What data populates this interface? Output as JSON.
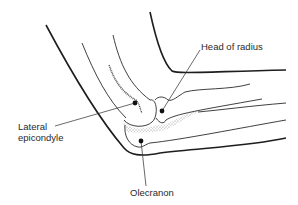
{
  "diagram": {
    "labels": {
      "head_of_radius": "Head of radius",
      "lateral_epicondyle_line1": "Lateral",
      "lateral_epicondyle_line2": "epicondyle",
      "olecranon": "Olecranon"
    },
    "colors": {
      "stroke": "#1e1e1e",
      "stipple": "#8a8a8a",
      "text": "#2a2a2a",
      "background": "#ffffff"
    },
    "landmarks": [
      {
        "name": "Lateral epicondyle",
        "dot": [
          135,
          103
        ]
      },
      {
        "name": "Head of radius",
        "dot": [
          162,
          111
        ]
      },
      {
        "name": "Olecranon",
        "dot": [
          141,
          141
        ]
      }
    ]
  }
}
